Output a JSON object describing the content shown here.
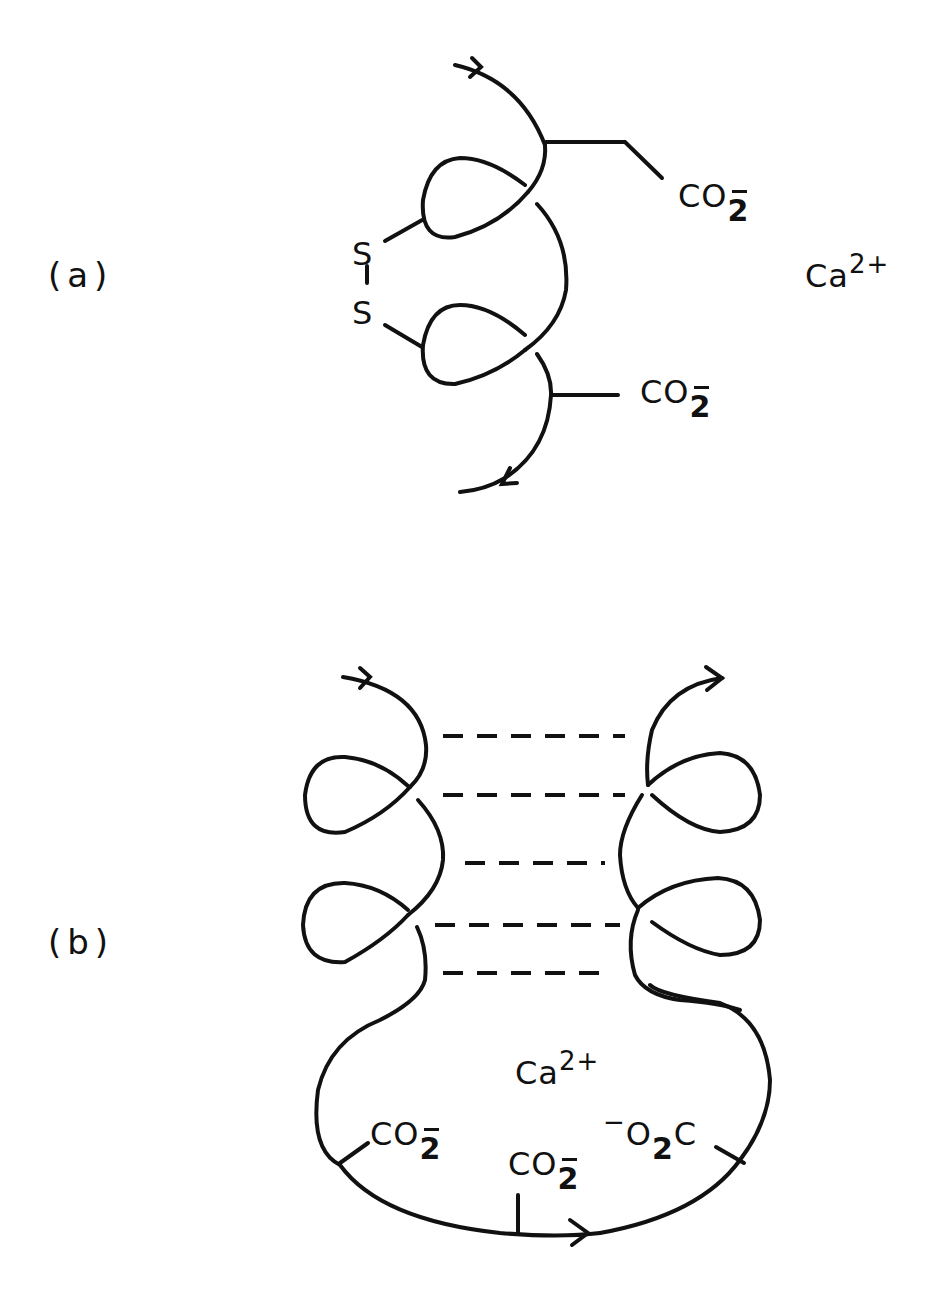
{
  "figure": {
    "panels": [
      {
        "id": "a",
        "label": "(a)",
        "description": "Single chain with two helical loops joined by a disulfide bridge, two carboxylate side chains, free calcium ion",
        "atoms": {
          "s_top": "S",
          "s_bottom": "S"
        },
        "groups": {
          "carboxylate_top": {
            "base": "CO",
            "sub": "2",
            "charge": "−"
          },
          "carboxylate_bottom": {
            "base": "CO",
            "sub": "2",
            "charge": "−"
          }
        },
        "ion": {
          "base": "Ca",
          "sup": "2+"
        }
      },
      {
        "id": "b",
        "label": "(b)",
        "description": "Two antiparallel helical strands linked by dashed hydrogen bonds forming a loop that chelates calcium with three carboxylates",
        "dashed_bonds": 5,
        "ion": {
          "base": "Ca",
          "sup": "2+"
        },
        "groups": {
          "carboxylate_left": {
            "base": "CO",
            "sub": "2",
            "charge": "−"
          },
          "carboxylate_middle": {
            "base": "CO",
            "sub": "2",
            "charge": "−"
          },
          "carboxylate_right": {
            "prefix": "−",
            "base": "O",
            "sub": "2",
            "tail": "C"
          }
        }
      }
    ],
    "colors": {
      "ink": "#111111",
      "background": "#ffffff"
    }
  }
}
